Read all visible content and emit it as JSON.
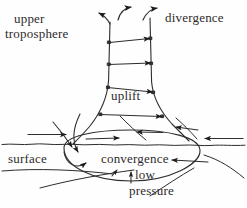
{
  "figure": {
    "type": "schematic-diagram",
    "background_color": "#fefefe",
    "ink_color": "#2e2c2c",
    "width": 247,
    "height": 208
  },
  "labels": {
    "upper": "upper",
    "troposphere": "troposphere",
    "divergence": "divergence",
    "uplift": "uplift",
    "surface": "surface",
    "convergence": "convergence",
    "low": "low",
    "pressure": "pressure"
  },
  "elements": {
    "column": "flared-updraft-column",
    "surface_line": "wavy-surface-line",
    "low_pressure_ellipse": "low-pressure-ellipse",
    "inflow_arrows": "converging-surface-arrows",
    "outflow_arrows": "diverging-upper-arrows",
    "uplift_arrows": "in-column-uplift-arrows"
  }
}
